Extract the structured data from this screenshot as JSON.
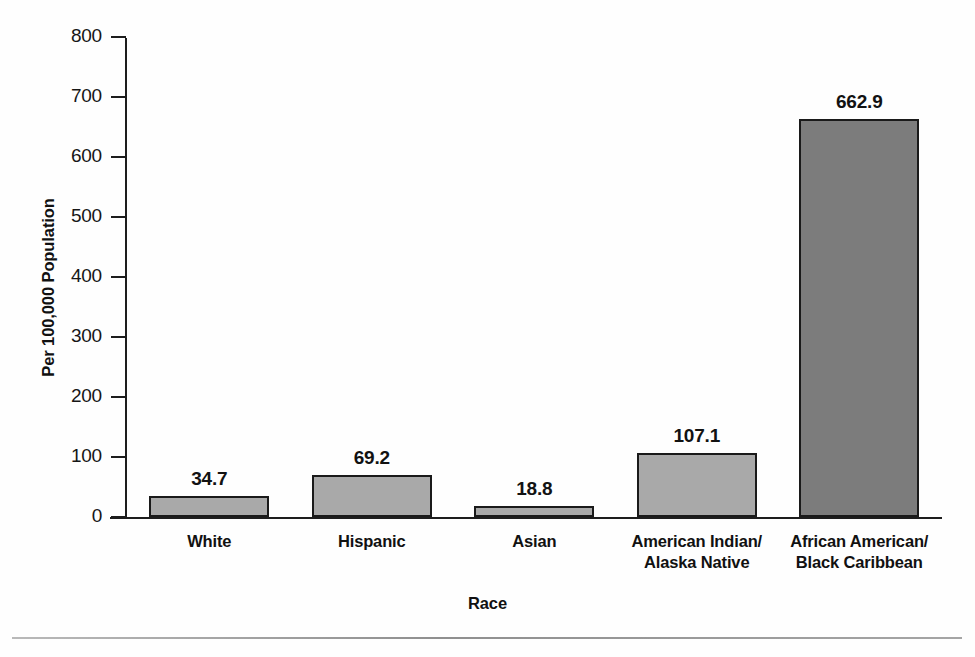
{
  "chart_data": {
    "type": "bar",
    "title": "",
    "xlabel": "Race",
    "ylabel": "Per 100,000 Population",
    "categories": [
      "White",
      "Hispanic",
      "Asian",
      "American Indian/\nAlaska Native",
      "African American/\nBlack Caribbean"
    ],
    "category_lines": [
      [
        "White"
      ],
      [
        "Hispanic"
      ],
      [
        "Asian"
      ],
      [
        "American Indian/",
        "Alaska Native"
      ],
      [
        "African American/",
        "Black Caribbean"
      ]
    ],
    "values": [
      34.7,
      69.2,
      18.8,
      107.1,
      662.9
    ],
    "value_labels": [
      "34.7",
      "69.2",
      "18.8",
      "107.1",
      "662.9"
    ],
    "ylim": [
      0,
      800
    ],
    "yticks": [
      0,
      100,
      200,
      300,
      400,
      500,
      600,
      700,
      800
    ],
    "ytick_labels": [
      "0",
      "100",
      "200",
      "300",
      "400",
      "500",
      "600",
      "700",
      "800"
    ],
    "grid": false,
    "legend": false,
    "bar_colors": [
      "#a9a9a9",
      "#a9a9a9",
      "#a9a9a9",
      "#a9a9a9",
      "#7c7c7c"
    ],
    "bar_outline_color": "#1a1a1a",
    "axis_color": "#1d1d1d",
    "background_color": "#fefefe"
  }
}
